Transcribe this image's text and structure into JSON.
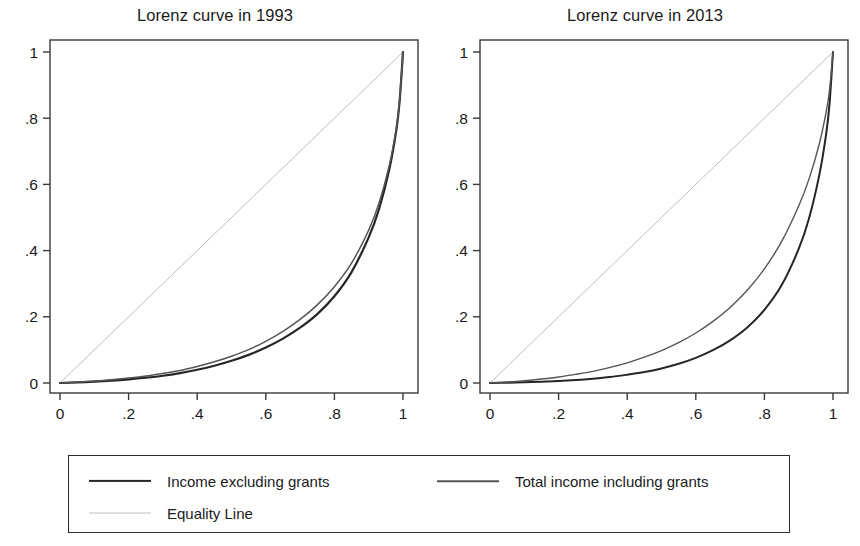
{
  "chart_data": [
    {
      "type": "line",
      "title": "Lorenz curve in 1993",
      "xlabel": "",
      "ylabel": "",
      "xlim": [
        0,
        1
      ],
      "ylim": [
        0,
        1
      ],
      "grid": false,
      "x_ticks": [
        "0",
        ".2",
        ".4",
        ".6",
        ".8",
        "1"
      ],
      "y_ticks": [
        "0",
        ".2",
        ".4",
        ".6",
        ".8",
        "1"
      ],
      "x_tick_values": [
        0,
        0.2,
        0.4,
        0.6,
        0.8,
        1
      ],
      "y_tick_values": [
        0,
        0.2,
        0.4,
        0.6,
        0.8,
        1
      ],
      "x": [
        0,
        0.05,
        0.1,
        0.15,
        0.2,
        0.25,
        0.3,
        0.35,
        0.4,
        0.45,
        0.5,
        0.55,
        0.6,
        0.65,
        0.7,
        0.75,
        0.8,
        0.85,
        0.9,
        0.93,
        0.96,
        0.98,
        0.99,
        1
      ],
      "series": [
        {
          "name": "Income excluding grants",
          "color": "#262626",
          "width": 2.2,
          "values": [
            0,
            0.002,
            0.004,
            0.007,
            0.011,
            0.016,
            0.022,
            0.03,
            0.04,
            0.052,
            0.067,
            0.085,
            0.107,
            0.134,
            0.167,
            0.208,
            0.262,
            0.335,
            0.44,
            0.525,
            0.645,
            0.76,
            0.85,
            1
          ]
        },
        {
          "name": "Total income including grants",
          "color": "#555555",
          "width": 1.5,
          "values": [
            0,
            0.003,
            0.006,
            0.01,
            0.015,
            0.021,
            0.029,
            0.038,
            0.05,
            0.064,
            0.081,
            0.101,
            0.126,
            0.156,
            0.192,
            0.236,
            0.291,
            0.362,
            0.462,
            0.543,
            0.657,
            0.767,
            0.854,
            1
          ]
        },
        {
          "name": "Equality Line",
          "color": "#bfbfbf",
          "width": 1.0,
          "values": [
            0,
            0.05,
            0.1,
            0.15,
            0.2,
            0.25,
            0.3,
            0.35,
            0.4,
            0.45,
            0.5,
            0.55,
            0.6,
            0.65,
            0.7,
            0.75,
            0.8,
            0.85,
            0.9,
            0.93,
            0.96,
            0.98,
            0.99,
            1
          ]
        }
      ]
    },
    {
      "type": "line",
      "title": "Lorenz curve in 2013",
      "xlabel": "",
      "ylabel": "",
      "xlim": [
        0,
        1
      ],
      "ylim": [
        0,
        1
      ],
      "grid": false,
      "x_ticks": [
        "0",
        ".2",
        ".4",
        ".6",
        ".8",
        "1"
      ],
      "y_ticks": [
        "0",
        ".2",
        ".4",
        ".6",
        ".8",
        "1"
      ],
      "x_tick_values": [
        0,
        0.2,
        0.4,
        0.6,
        0.8,
        1
      ],
      "y_tick_values": [
        0,
        0.2,
        0.4,
        0.6,
        0.8,
        1
      ],
      "x": [
        0,
        0.05,
        0.1,
        0.15,
        0.2,
        0.25,
        0.3,
        0.35,
        0.4,
        0.45,
        0.5,
        0.55,
        0.6,
        0.65,
        0.7,
        0.75,
        0.8,
        0.85,
        0.9,
        0.93,
        0.96,
        0.98,
        0.99,
        1
      ],
      "series": [
        {
          "name": "Income excluding grants",
          "color": "#262626",
          "width": 2.0,
          "values": [
            0,
            0.001,
            0.002,
            0.004,
            0.006,
            0.009,
            0.013,
            0.018,
            0.025,
            0.033,
            0.044,
            0.058,
            0.076,
            0.099,
            0.129,
            0.168,
            0.221,
            0.295,
            0.405,
            0.497,
            0.628,
            0.752,
            0.845,
            1
          ]
        },
        {
          "name": "Total income including grants",
          "color": "#555555",
          "width": 1.4,
          "values": [
            0,
            0.003,
            0.007,
            0.012,
            0.018,
            0.026,
            0.035,
            0.047,
            0.061,
            0.078,
            0.098,
            0.122,
            0.151,
            0.186,
            0.228,
            0.28,
            0.345,
            0.427,
            0.535,
            0.616,
            0.722,
            0.818,
            0.886,
            1
          ]
        },
        {
          "name": "Equality Line",
          "color": "#bfbfbf",
          "width": 1.0,
          "values": [
            0,
            0.05,
            0.1,
            0.15,
            0.2,
            0.25,
            0.3,
            0.35,
            0.4,
            0.45,
            0.5,
            0.55,
            0.6,
            0.65,
            0.7,
            0.75,
            0.8,
            0.85,
            0.9,
            0.93,
            0.96,
            0.98,
            0.99,
            1
          ]
        }
      ]
    }
  ],
  "panels": [
    {
      "title": "Lorenz curve in 1993"
    },
    {
      "title": "Lorenz curve in 2013"
    }
  ],
  "legend": {
    "entries": [
      {
        "label": "Income excluding grants",
        "style": "dark"
      },
      {
        "label": "Total income including grants",
        "style": "mid"
      },
      {
        "label": "Equality Line",
        "style": "light"
      }
    ]
  },
  "colors": {
    "income_excluding_grants": "#262626",
    "total_income_including_grants": "#555555",
    "equality_line": "#bfbfbf",
    "axis": "#3a3a3a",
    "text": "#1b1b1b",
    "background": "#ffffff"
  }
}
